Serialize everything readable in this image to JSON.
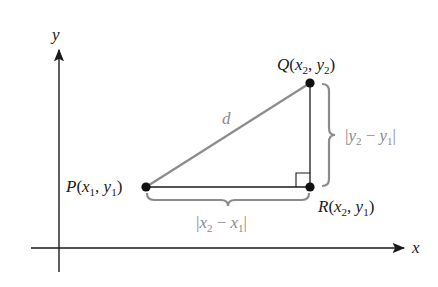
{
  "diagram": {
    "axes": {
      "x_label": "x",
      "y_label": "y"
    },
    "points": {
      "P": {
        "name": "P",
        "x_sub": "1",
        "y_sub": "1",
        "label": "P(x1, y1)"
      },
      "Q": {
        "name": "Q",
        "x_sub": "2",
        "y_sub": "2",
        "label": "Q(x2, y2)"
      },
      "R": {
        "name": "R",
        "x_sub": "2",
        "y_sub": "1",
        "label": "R(x2, y1)"
      }
    },
    "segments": {
      "hypotenuse_label": "d",
      "horizontal_label": "|x2 − x1|",
      "vertical_label": "|y2 − y1|"
    },
    "colors": {
      "axis": "#1a1a1a",
      "hypotenuse": "#8c8c8c",
      "legs": "#1a1a1a",
      "brace": "#8c8c8c",
      "point": "#111111",
      "gray_text": "#8a8a8a"
    }
  }
}
